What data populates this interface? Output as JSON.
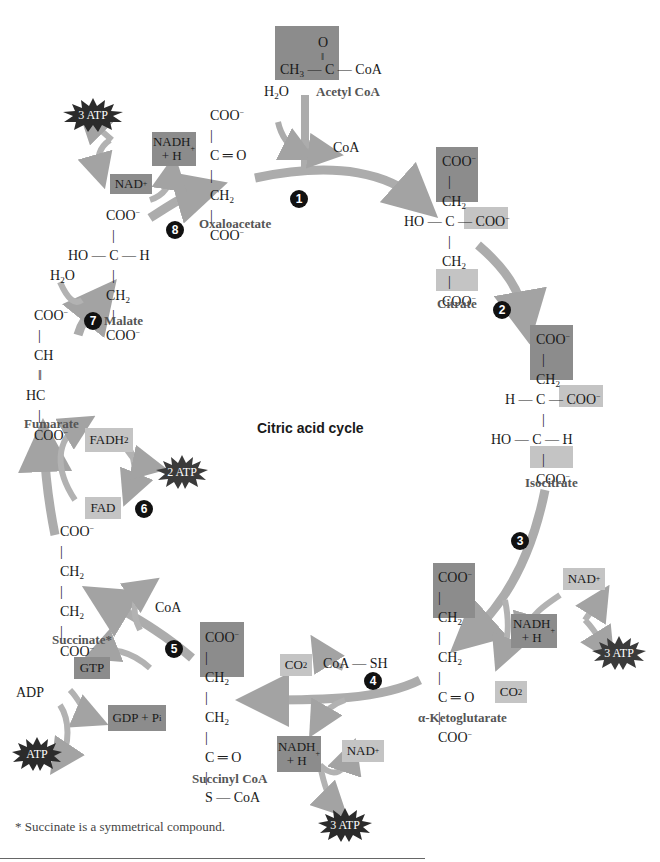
{
  "title": "Citric acid cycle",
  "footnote": "* Succinate is a symmetrical compound.",
  "colors": {
    "highlight_dark": "#8c8c8c",
    "highlight_light": "#c4c4c4",
    "arrow": "#a8a8a8",
    "atp_burst": "#2b2b2b",
    "step_marker": "#111111"
  },
  "steps": [
    "1",
    "2",
    "3",
    "4",
    "5",
    "6",
    "7",
    "8"
  ],
  "compounds": {
    "acetyl_coa": {
      "name": "Acetyl CoA",
      "top": "O",
      "main": "CH3 — C — CoA"
    },
    "oxaloacetate": {
      "name": "Oxaloacetate",
      "lines": [
        "COO−",
        "C═O",
        "CH2",
        "COO−"
      ]
    },
    "citrate": {
      "name": "Citrate",
      "lines": [
        "COO−",
        "CH2",
        "HO — C — COO−",
        "CH2",
        "COO−"
      ]
    },
    "isocitrate": {
      "name": "Isocitrate",
      "lines": [
        "COO−",
        "CH2",
        "H — C — COO−",
        "HO — C — H",
        "COO−"
      ]
    },
    "alpha_ketoglutarate": {
      "name": "α-Ketoglutarate",
      "lines": [
        "COO−",
        "CH2",
        "CH2",
        "C═O",
        "COO−"
      ]
    },
    "succinyl_coa": {
      "name": "Succinyl CoA",
      "lines": [
        "COO−",
        "CH2",
        "CH2",
        "C═O",
        "S — CoA"
      ]
    },
    "succinate": {
      "name": "Succinate*",
      "lines": [
        "COO−",
        "CH2",
        "CH2",
        "COO−"
      ]
    },
    "fumarate": {
      "name": "Fumarate",
      "lines": [
        "COO−",
        "CH",
        "HC",
        "COO−"
      ]
    },
    "malate": {
      "name": "Malate",
      "lines": [
        "COO−",
        "HO — C — H",
        "CH2",
        "COO−"
      ]
    }
  },
  "cofactors": {
    "step1_in": "H2O",
    "step1_out": "CoA",
    "step8_nad": "NAD+",
    "step8_nadh": "NADH + H+",
    "step8_atp": "3 ATP",
    "step7_in": "H2O",
    "step6_fadh2": "FADH2",
    "step6_fad": "FAD",
    "step6_atp": "2 ATP",
    "step5_coa": "CoA",
    "step5_gtp": "GTP",
    "step5_gdp": "GDP + Pi",
    "step5_adp": "ADP",
    "step5_atp": "ATP",
    "step4_co2": "CO2",
    "step4_coash": "CoA — SH",
    "step4_nadh": "NADH + H+",
    "step4_nad": "NAD+",
    "step4_atp": "3 ATP",
    "step3_nad": "NAD+",
    "step3_nadh": "NADH + H+",
    "step3_co2": "CO2",
    "step3_atp": "3 ATP"
  }
}
